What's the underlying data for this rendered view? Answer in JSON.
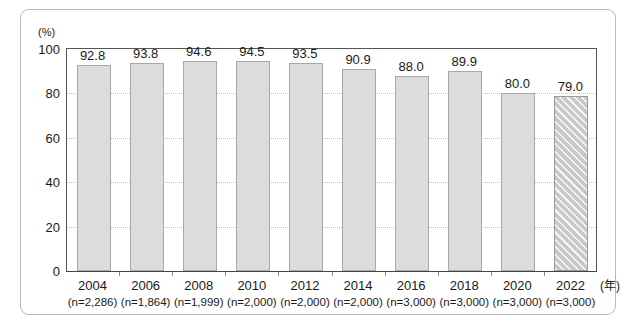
{
  "figure": {
    "unit_label": "(%)",
    "x_axis_unit": "(年)"
  },
  "chart_data": {
    "type": "bar",
    "title": "",
    "subtitle": "",
    "xlabel": "(年)",
    "ylabel": "(%)",
    "ylim": [
      0,
      100
    ],
    "yticks": [
      0,
      20,
      40,
      60,
      80,
      100
    ],
    "ytick_labels": [
      "0",
      "20",
      "40",
      "60",
      "80",
      "100"
    ],
    "grid": "horizontal dotted gridlines at 20, 40, 60, 80",
    "legend": "none",
    "categories": [
      "2004",
      "2006",
      "2008",
      "2010",
      "2012",
      "2014",
      "2016",
      "2018",
      "2020",
      "2022"
    ],
    "sample_sizes": [
      "(n=2,286)",
      "(n=1,864)",
      "(n=1,999)",
      "(n=2,000)",
      "(n=2,000)",
      "(n=2,000)",
      "(n=3,000)",
      "(n=3,000)",
      "(n=3,000)",
      "(n=3,000)"
    ],
    "values": [
      92.8,
      93.8,
      94.6,
      94.5,
      93.5,
      90.9,
      88.0,
      89.9,
      80.0,
      79.0
    ],
    "value_labels": [
      "92.8",
      "93.8",
      "94.6",
      "94.5",
      "93.5",
      "90.9",
      "88.0",
      "89.9",
      "80.0",
      "79.0"
    ],
    "bar_styles": [
      "solid",
      "solid",
      "solid",
      "solid",
      "solid",
      "solid",
      "solid",
      "solid",
      "solid",
      "hatched"
    ],
    "colors": {
      "bar_fill": "#dcdcdc",
      "bar_border": "#a8a8a8",
      "hatched_fill": "#c9c9c9",
      "gridline": "#c2c2c2",
      "axis": "#555555",
      "text": "#1a1a1a",
      "frame": "#b9b9b9"
    }
  }
}
